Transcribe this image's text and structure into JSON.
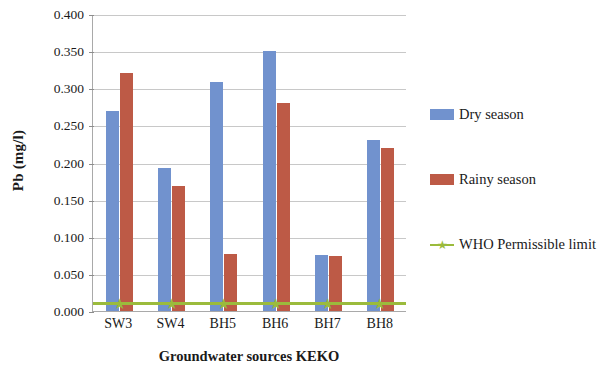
{
  "chart_data": {
    "type": "bar",
    "title": "",
    "xlabel": "Groundwater sources KEKO",
    "ylabel": "Pb (mg/l)",
    "categories": [
      "SW3",
      "SW4",
      "BH5",
      "BH6",
      "BH7",
      "BH8"
    ],
    "series": [
      {
        "name": "Dry season",
        "type": "bar",
        "color": "#7192ce",
        "values": [
          0.27,
          0.193,
          0.308,
          0.35,
          0.076,
          0.23
        ]
      },
      {
        "name": "Rainy season",
        "type": "bar",
        "color": "#bd5a46",
        "values": [
          0.32,
          0.168,
          0.077,
          0.28,
          0.074,
          0.219
        ]
      },
      {
        "name": "WHO Permissible limit",
        "type": "line",
        "color": "#9bbb3c",
        "values": [
          0.01,
          0.01,
          0.01,
          0.01,
          0.01,
          0.01
        ]
      }
    ],
    "ylim": [
      0.0,
      0.4
    ],
    "ytick_step": 0.05,
    "ytick_labels": [
      "0.000",
      "0.050",
      "0.100",
      "0.150",
      "0.200",
      "0.250",
      "0.300",
      "0.350",
      "0.400"
    ],
    "ytick_values": [
      0.0,
      0.05,
      0.1,
      0.15,
      0.2,
      0.25,
      0.3,
      0.35,
      0.4
    ],
    "grid": true,
    "legend_position": "right"
  },
  "legend": {
    "entries": [
      {
        "label": "Dry season",
        "marker": "square-swatch",
        "color": "#7192ce"
      },
      {
        "label": "Rainy season",
        "marker": "square-swatch",
        "color": "#bd5a46"
      },
      {
        "label": "WHO Permissible limit",
        "marker": "line-star-marker",
        "color": "#9bbb3c"
      }
    ]
  },
  "colors": {
    "dry_season": "#7192ce",
    "rainy_season": "#bd5a46",
    "who_limit": "#9bbb3c",
    "gridline": "#c8c8c8",
    "axis": "#a9a9a9",
    "background": "#ffffff"
  }
}
